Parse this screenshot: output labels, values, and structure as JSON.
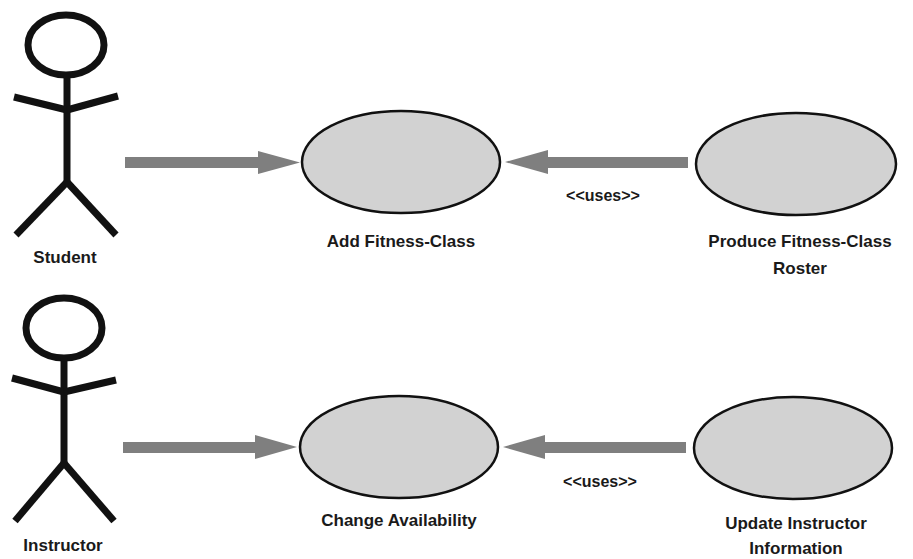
{
  "colors": {
    "arrow": "#7f7f7f",
    "usecase_fill": "#d2d2d2",
    "stroke": "#111111"
  },
  "actors": [
    {
      "name": "Student"
    },
    {
      "name": "Instructor"
    }
  ],
  "use_cases": [
    {
      "label": "Add Fitness-Class"
    },
    {
      "label_line1": "Produce Fitness-Class",
      "label_line2": "Roster"
    },
    {
      "label": "Change Availability"
    },
    {
      "label_line1": "Update Instructor",
      "label_line2": "Information"
    }
  ],
  "relationships": [
    {
      "from": "Student",
      "to": "Add Fitness-Class",
      "label": ""
    },
    {
      "from": "Produce Fitness-Class Roster",
      "to": "Add Fitness-Class",
      "label": "<<uses>>"
    },
    {
      "from": "Instructor",
      "to": "Change Availability",
      "label": ""
    },
    {
      "from": "Update Instructor Information",
      "to": "Change Availability",
      "label": "<<uses>>"
    }
  ]
}
